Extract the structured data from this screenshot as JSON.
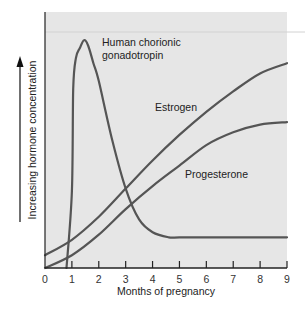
{
  "chart_data": {
    "type": "line",
    "title": "",
    "xlabel": "Months of pregnancy",
    "ylabel": "Increasing hormone concentration",
    "xlim": [
      0,
      9
    ],
    "ylim": [
      0,
      100
    ],
    "x_ticks": [
      "0",
      "1",
      "2",
      "3",
      "4",
      "5",
      "6",
      "7",
      "8",
      "9"
    ],
    "grid": false,
    "legend": "inline labels",
    "series": [
      {
        "name": "Human chorionic gonadotropin",
        "label_lines": [
          "Human chorionic",
          "gonadotropin"
        ],
        "x": [
          0.8,
          1.0,
          1.05,
          1.15,
          1.3,
          1.45,
          1.6,
          1.8,
          2.0,
          2.5,
          3.0,
          3.5,
          4.0,
          4.6,
          5.0,
          6.0,
          7.0,
          8.0,
          9.0
        ],
        "values": [
          0,
          30,
          70,
          82,
          86,
          89,
          87,
          80,
          73,
          50,
          31,
          19,
          14,
          12,
          12,
          12,
          12,
          12,
          12
        ]
      },
      {
        "name": "Estrogen",
        "x": [
          0,
          1,
          2,
          3,
          4,
          5,
          6,
          7,
          8,
          9
        ],
        "values": [
          5,
          11,
          20,
          31,
          42,
          52,
          61,
          69,
          76,
          80
        ]
      },
      {
        "name": "Progesterone",
        "x": [
          0,
          1,
          2,
          3,
          4,
          5,
          6,
          7,
          8,
          9
        ],
        "values": [
          0,
          5,
          13,
          23,
          32,
          40,
          48,
          53,
          56,
          57
        ]
      }
    ],
    "annotations": [
      "Upward arrow alongside y-axis label indicating increasing concentration"
    ]
  },
  "colors": {
    "plot_background": "#e6e6e6",
    "line": "#555555",
    "axis": "#222222"
  }
}
